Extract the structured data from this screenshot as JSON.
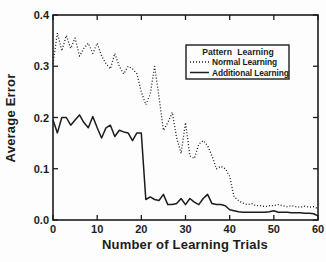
{
  "figure": {
    "ink_color": "#1c1c1c",
    "paper_color": "#fdfdfd"
  },
  "chart_data": {
    "type": "line",
    "title": "",
    "xlabel": "Number of Learning Trials",
    "ylabel": "Average Error",
    "xlim": [
      0,
      60
    ],
    "ylim": [
      0,
      0.4
    ],
    "xticks": [
      0,
      10,
      20,
      30,
      40,
      50,
      60
    ],
    "yticks": [
      {
        "label": "0.0",
        "value": 0.0
      },
      {
        "label": "0.1",
        "value": 0.1
      },
      {
        "label": "0.2",
        "value": 0.2
      },
      {
        "label": "0.3",
        "value": 0.3
      },
      {
        "label": "0.4",
        "value": 0.4
      }
    ],
    "grid": false,
    "legend": {
      "title": "Pattern Learning",
      "position": "upper-right",
      "entries": [
        {
          "label": "Normal Learning",
          "style": "dotted"
        },
        {
          "label": "Additional Learning",
          "style": "solid"
        }
      ]
    },
    "x_start": 0,
    "x_step": 1,
    "series": [
      {
        "name": "Normal Learning",
        "style": "dotted",
        "values": [
          0.305,
          0.365,
          0.33,
          0.36,
          0.335,
          0.355,
          0.32,
          0.335,
          0.345,
          0.325,
          0.345,
          0.32,
          0.305,
          0.295,
          0.325,
          0.3,
          0.285,
          0.3,
          0.295,
          0.285,
          0.25,
          0.225,
          0.245,
          0.3,
          0.24,
          0.175,
          0.19,
          0.21,
          0.16,
          0.13,
          0.19,
          0.125,
          0.12,
          0.148,
          0.155,
          0.145,
          0.125,
          0.1,
          0.105,
          0.1,
          0.085,
          0.045,
          0.038,
          0.033,
          0.03,
          0.032,
          0.028,
          0.028,
          0.026,
          0.028,
          0.028,
          0.03,
          0.028,
          0.026,
          0.028,
          0.026,
          0.025,
          0.027,
          0.025,
          0.026,
          0.022
        ]
      },
      {
        "name": "Additional Learning",
        "style": "solid",
        "values": [
          0.195,
          0.17,
          0.2,
          0.2,
          0.185,
          0.195,
          0.205,
          0.19,
          0.18,
          0.202,
          0.18,
          0.16,
          0.18,
          0.185,
          0.163,
          0.175,
          0.172,
          0.17,
          0.155,
          0.17,
          0.17,
          0.04,
          0.045,
          0.04,
          0.038,
          0.05,
          0.03,
          0.03,
          0.032,
          0.042,
          0.03,
          0.042,
          0.035,
          0.03,
          0.042,
          0.05,
          0.032,
          0.03,
          0.03,
          0.028,
          0.02,
          0.018,
          0.016,
          0.015,
          0.015,
          0.015,
          0.015,
          0.015,
          0.015,
          0.016,
          0.018,
          0.015,
          0.015,
          0.015,
          0.014,
          0.014,
          0.014,
          0.013,
          0.013,
          0.012,
          0.008
        ]
      }
    ]
  }
}
